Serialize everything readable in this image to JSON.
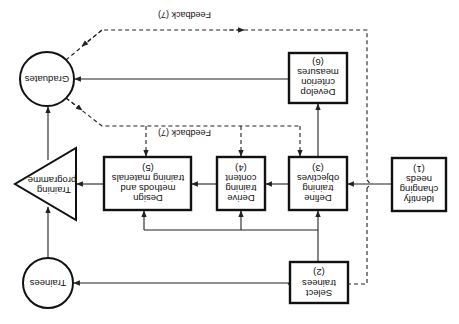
{
  "diagram": {
    "orientation": "rotated 180 degrees",
    "nodes": {
      "identify": {
        "lines": [
          "Identify",
          "changing",
          "needs",
          "(1)"
        ]
      },
      "select": {
        "lines": [
          "Select",
          "trainees",
          "(2)"
        ]
      },
      "define": {
        "lines": [
          "Define",
          "training",
          "objectives",
          "(3)"
        ]
      },
      "derive": {
        "lines": [
          "Derive",
          "training",
          "content",
          "(4)"
        ]
      },
      "design": {
        "lines": [
          "Design",
          "methods and",
          "training materials",
          "(5)"
        ]
      },
      "develop": {
        "lines": [
          "Develop",
          "criterion",
          "measures",
          "(6)"
        ]
      },
      "trainees": {
        "label": "Trainees"
      },
      "programme": {
        "lines": [
          "Training",
          "programme"
        ]
      },
      "graduates": {
        "label": "Graduates"
      }
    },
    "feedback_label": "Feedback (7)",
    "feedback_label_upper": "Feedback (7)",
    "edges": [
      {
        "from": "identify",
        "to": "define",
        "style": "solid"
      },
      {
        "from": "select",
        "to": "define",
        "style": "solid"
      },
      {
        "from": "select",
        "to": "derive",
        "style": "solid"
      },
      {
        "from": "select",
        "to": "design",
        "style": "solid"
      },
      {
        "from": "select",
        "to": "trainees",
        "style": "solid"
      },
      {
        "from": "define",
        "to": "derive",
        "style": "solid"
      },
      {
        "from": "define",
        "to": "develop",
        "style": "solid"
      },
      {
        "from": "derive",
        "to": "design",
        "style": "solid"
      },
      {
        "from": "design",
        "to": "programme",
        "style": "solid"
      },
      {
        "from": "trainees",
        "to": "programme",
        "style": "solid"
      },
      {
        "from": "programme",
        "to": "graduates",
        "style": "solid"
      },
      {
        "from": "develop",
        "to": "graduates",
        "style": "solid"
      },
      {
        "from": "graduates",
        "to": "define",
        "style": "dashed",
        "label": "Feedback (7)"
      },
      {
        "from": "graduates",
        "to": "derive",
        "style": "dashed"
      },
      {
        "from": "graduates",
        "to": "design",
        "style": "dashed"
      },
      {
        "from": "graduates",
        "to": "select",
        "style": "dashed",
        "label": "Feedback (7)"
      }
    ]
  }
}
